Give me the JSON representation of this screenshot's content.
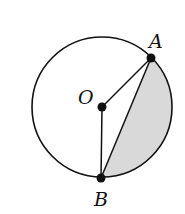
{
  "diagram": {
    "type": "circle-geometry",
    "colors": {
      "stroke": "#111111",
      "shade": "#d9d9d9",
      "background": "#ffffff"
    },
    "circle": {
      "center": [
        102,
        107
      ],
      "radius": 70
    },
    "points": [
      {
        "id": "A",
        "label": "A",
        "x": 151,
        "y": 58,
        "label_x": 149,
        "label_y": 48
      },
      {
        "id": "O",
        "label": "O",
        "x": 102,
        "y": 107,
        "label_x": 78,
        "label_y": 104
      },
      {
        "id": "B",
        "label": "B",
        "x": 101,
        "y": 178,
        "label_x": 94,
        "label_y": 206
      }
    ],
    "segments": [
      {
        "from": "O",
        "to": "A"
      },
      {
        "from": "O",
        "to": "B"
      },
      {
        "from": "A",
        "to": "B"
      }
    ],
    "shaded_region": "segment between chord AB and minor arc AB"
  }
}
